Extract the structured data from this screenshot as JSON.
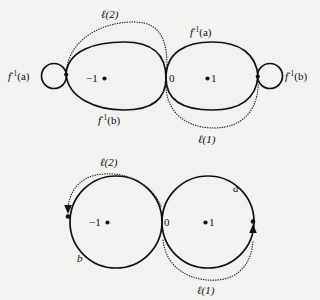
{
  "figure": {
    "background_color": "#f2f2f1",
    "ink_color": "#111111",
    "panels": [
      {
        "id": "top-panel",
        "name": "inverse-image-diagram",
        "labels": {
          "left_loop": "f",
          "left_loop_sup": "-1",
          "left_loop_arg": "(a)",
          "right_loop": "f",
          "right_loop_sup": "-1",
          "right_loop_arg": "(b)",
          "upper_arc": "f",
          "upper_arc_sup": "-1",
          "upper_arc_arg": "(a)",
          "lower_arc": "f",
          "lower_arc_sup": "-1",
          "lower_arc_arg": "(b)",
          "ell_two": "ℓ(2)",
          "ell_one": "ℓ(1)",
          "node_minus_one": "−1",
          "node_zero": "0",
          "node_one": "1"
        }
      },
      {
        "id": "bottom-panel",
        "name": "loop-pair-diagram",
        "labels": {
          "left_circle": "b",
          "right_circle": "a",
          "ell_two": "ℓ(2)",
          "ell_one": "ℓ(1)",
          "node_minus_one": "−1",
          "node_zero": "0",
          "node_one": "1"
        }
      }
    ]
  }
}
